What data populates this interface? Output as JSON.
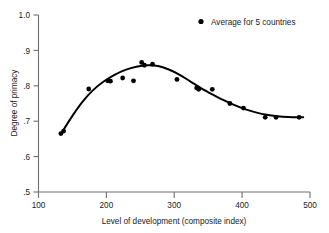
{
  "chart_data": {
    "type": "scatter",
    "title": "",
    "xlabel": "Level of development (composite index)",
    "ylabel": "Degree of primacy",
    "xlim": [
      100,
      500
    ],
    "ylim": [
      0.5,
      1.0
    ],
    "xticks": [
      100,
      200,
      300,
      400,
      500
    ],
    "xtick_labels": [
      "100",
      "200",
      "300",
      "400",
      "500"
    ],
    "yticks": [
      0.5,
      0.6,
      0.7,
      0.8,
      0.9,
      1.0
    ],
    "ytick_labels": [
      ".5",
      ".6",
      ".7",
      ".8",
      ".9",
      "1.0"
    ],
    "grid": false,
    "legend_position": "top-right",
    "legend": [
      {
        "label": "Average for 5 countries",
        "marker": "filled-circle",
        "color": "#000000"
      }
    ],
    "series": [
      {
        "name": "Average for 5 countries",
        "marker": "filled-circle",
        "color": "#000000",
        "points": [
          {
            "x": 133,
            "y": 0.665
          },
          {
            "x": 137,
            "y": 0.672
          },
          {
            "x": 174,
            "y": 0.791
          },
          {
            "x": 202,
            "y": 0.814
          },
          {
            "x": 206,
            "y": 0.813
          },
          {
            "x": 224,
            "y": 0.822
          },
          {
            "x": 240,
            "y": 0.814
          },
          {
            "x": 252,
            "y": 0.866
          },
          {
            "x": 256,
            "y": 0.858
          },
          {
            "x": 268,
            "y": 0.861
          },
          {
            "x": 304,
            "y": 0.818
          },
          {
            "x": 333,
            "y": 0.794
          },
          {
            "x": 336,
            "y": 0.79
          },
          {
            "x": 356,
            "y": 0.79
          },
          {
            "x": 382,
            "y": 0.75
          },
          {
            "x": 402,
            "y": 0.737
          },
          {
            "x": 434,
            "y": 0.711
          },
          {
            "x": 450,
            "y": 0.711
          },
          {
            "x": 484,
            "y": 0.711
          }
        ]
      }
    ],
    "fitted_curve": {
      "name": "fitted trend",
      "color": "#000000",
      "points": [
        {
          "x": 134,
          "y": 0.667
        },
        {
          "x": 150,
          "y": 0.715
        },
        {
          "x": 165,
          "y": 0.755
        },
        {
          "x": 180,
          "y": 0.787
        },
        {
          "x": 196,
          "y": 0.812
        },
        {
          "x": 212,
          "y": 0.831
        },
        {
          "x": 228,
          "y": 0.845
        },
        {
          "x": 244,
          "y": 0.854
        },
        {
          "x": 260,
          "y": 0.858
        },
        {
          "x": 276,
          "y": 0.856
        },
        {
          "x": 292,
          "y": 0.846
        },
        {
          "x": 308,
          "y": 0.831
        },
        {
          "x": 324,
          "y": 0.812
        },
        {
          "x": 340,
          "y": 0.793
        },
        {
          "x": 356,
          "y": 0.776
        },
        {
          "x": 372,
          "y": 0.76
        },
        {
          "x": 388,
          "y": 0.746
        },
        {
          "x": 404,
          "y": 0.734
        },
        {
          "x": 420,
          "y": 0.725
        },
        {
          "x": 436,
          "y": 0.718
        },
        {
          "x": 452,
          "y": 0.714
        },
        {
          "x": 468,
          "y": 0.712
        },
        {
          "x": 490,
          "y": 0.711
        }
      ]
    }
  }
}
